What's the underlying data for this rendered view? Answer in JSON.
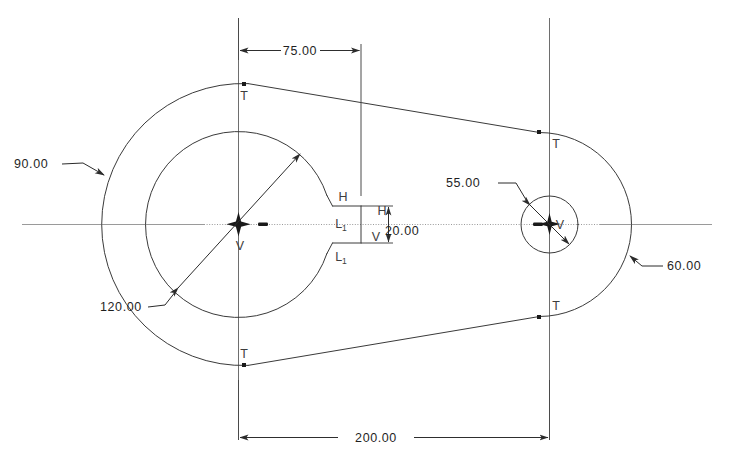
{
  "drawing": {
    "title": "Crank Arm / Link Plate Sketch",
    "kind": "2d-parametric-sketch",
    "units": "mm",
    "background_color": "#ffffff",
    "geometry_color": "#3a3a3a",
    "centerline_color": "#9a9a9a",
    "dimension_color": "#1f1f1f",
    "constraint_color": "#3d3d3d"
  },
  "dimensions": [
    {
      "id": "dim-75",
      "value": "75.00",
      "type": "linear-horizontal",
      "placement": "top",
      "description": "horizontal distance from left center to keyway face"
    },
    {
      "id": "dim-200",
      "value": "200.00",
      "type": "linear-horizontal",
      "placement": "bottom",
      "description": "center to center distance"
    },
    {
      "id": "dim-20",
      "value": "20.00",
      "type": "linear-vertical",
      "placement": "center-detail",
      "description": "keyway slot height"
    },
    {
      "id": "dim-90",
      "value": "90.00",
      "type": "radius",
      "placement": "upper-left",
      "description": "large outer boss radius"
    },
    {
      "id": "dim-120",
      "value": "120.00",
      "type": "diameter",
      "placement": "lower-left",
      "description": "large inner bore diameter"
    },
    {
      "id": "dim-55",
      "value": "55.00",
      "type": "diameter",
      "placement": "center-right",
      "description": "small bore diameter"
    },
    {
      "id": "dim-60",
      "value": "60.00",
      "type": "radius",
      "placement": "right",
      "description": "small outer boss radius"
    }
  ],
  "constraints": [
    {
      "id": "c-t-top-left",
      "label": "T",
      "meaning": "tangent"
    },
    {
      "id": "c-t-bottom-left",
      "label": "T",
      "meaning": "tangent"
    },
    {
      "id": "c-t-top-right",
      "label": "T",
      "meaning": "tangent"
    },
    {
      "id": "c-t-bottom-right",
      "label": "T",
      "meaning": "tangent"
    },
    {
      "id": "c-v-left",
      "label": "V",
      "meaning": "vertical"
    },
    {
      "id": "c-v-right",
      "label": "V",
      "meaning": "vertical"
    },
    {
      "id": "c-h-upper",
      "label": "H",
      "meaning": "horizontal"
    },
    {
      "id": "c-h-inner",
      "label": "H",
      "meaning": "horizontal"
    },
    {
      "id": "c-v-inner",
      "label": "V",
      "meaning": "vertical"
    },
    {
      "id": "c-l1-upper",
      "label": "L",
      "sub": "1",
      "meaning": "equal-length"
    },
    {
      "id": "c-l1-lower",
      "label": "L",
      "sub": "1",
      "meaning": "equal-length"
    }
  ],
  "features": {
    "left_boss": {
      "name": "large-boss",
      "center_label": "V"
    },
    "right_boss": {
      "name": "small-boss",
      "center_label": "V"
    },
    "keyway": {
      "name": "keyway-slot"
    }
  }
}
